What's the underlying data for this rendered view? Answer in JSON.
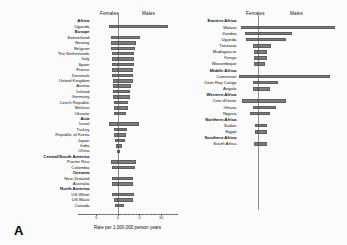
{
  "figure": {
    "axis_title": "Rate per 1,000,000 person years",
    "female_header": "Females",
    "male_header": "Males",
    "panel_a_letter": "A",
    "panel_b_letter": "B",
    "bar_color": "#7d7d7d",
    "bar_edge_color": "#5e5e5e",
    "axis_color": "#6f6f6f",
    "background": "#fbfbfb"
  },
  "chart_data": [
    {
      "type": "bar",
      "id": "panel-a",
      "title": "",
      "orientation": "horizontal-diverging",
      "xlabel": "Rate per 1,000,000 person years",
      "ylabel": "",
      "xlim": [
        -6,
        13
      ],
      "xticks": [
        -5,
        0,
        5,
        10
      ],
      "xticklabels": [
        "5",
        "0",
        "5",
        "10"
      ],
      "grid": false,
      "legend_position": "top",
      "series": [
        {
          "name": "Females",
          "direction": "left"
        },
        {
          "name": "Males",
          "direction": "right"
        }
      ],
      "categories": [
        "Africa",
        "Uganda",
        "Europe",
        "Switzerland",
        "Norway",
        "Belgium",
        "The Netherlands",
        "Italy",
        "Spain",
        "France",
        "Denmark",
        "United Kingdom",
        "Austria",
        "Ireland",
        "Germany",
        "Czech Republic",
        "Belarus",
        "Ukraine",
        "Asia",
        "Israel",
        "Turkey",
        "Republic of Korea",
        "Japan",
        "India",
        "China",
        "Central/South America",
        "Puerto Rico",
        "Colombia",
        "Oceania",
        "New Zealand",
        "Australia",
        "North America",
        "US White",
        "US Black",
        "Canada"
      ],
      "group_rows": [
        "Africa",
        "Europe",
        "Asia",
        "Central/South America",
        "Oceania",
        "North America"
      ],
      "females": [
        null,
        2.0,
        null,
        1.6,
        1.5,
        1.5,
        1.4,
        1.4,
        1.3,
        1.3,
        1.3,
        1.2,
        1.1,
        1.1,
        1.1,
        1.0,
        0.9,
        0.8,
        null,
        2.0,
        0.9,
        0.8,
        0.7,
        0.5,
        0.2,
        null,
        1.6,
        1.3,
        null,
        1.3,
        1.3,
        null,
        1.3,
        1.0,
        0.7
      ],
      "males": [
        null,
        11.6,
        null,
        5.2,
        4.2,
        4.0,
        3.8,
        3.8,
        3.7,
        3.6,
        3.4,
        3.4,
        3.0,
        2.9,
        2.8,
        2.4,
        2.3,
        1.8,
        null,
        5.0,
        2.2,
        1.8,
        1.6,
        0.9,
        0.3,
        null,
        4.2,
        3.9,
        null,
        3.6,
        3.6,
        null,
        3.7,
        3.5,
        1.5
      ]
    },
    {
      "type": "bar",
      "id": "panel-b",
      "title": "",
      "orientation": "horizontal-diverging",
      "xlabel": "Rate per 1,000,000 person years",
      "ylabel": "",
      "xlim": [
        -8,
        34
      ],
      "xticks": [
        -5,
        0,
        5,
        10,
        30
      ],
      "xticklabels": [
        "5",
        "0",
        "5",
        "10",
        "30"
      ],
      "grid": false,
      "legend_position": "top",
      "series": [
        {
          "name": "Females",
          "direction": "left"
        },
        {
          "name": "Males",
          "direction": "right"
        }
      ],
      "categories": [
        "Eastern Africa",
        "Malawi",
        "Zambia",
        "Uganda",
        "Tanzania",
        "Madagascar",
        "Kenya",
        "Mozambique",
        "Middle Africa",
        "Cameroon",
        "Dem Rep Congo",
        "Angola",
        "Western Africa",
        "Cote d'Ivoire",
        "Ghana",
        "Nigeria",
        "Northern Africa",
        "Sudan",
        "Egypt",
        "Southern Africa",
        "South Africa"
      ],
      "group_rows": [
        "Eastern Africa",
        "Middle Africa",
        "Western Africa",
        "Northern Africa",
        "Southern Africa"
      ],
      "females": [
        null,
        7.0,
        5.5,
        5.0,
        2.2,
        2.0,
        1.8,
        1.8,
        null,
        7.8,
        2.4,
        2.2,
        null,
        6.6,
        2.4,
        3.6,
        null,
        1.4,
        1.4,
        null,
        1.8
      ],
      "males": [
        null,
        31.5,
        14.0,
        11.5,
        5.2,
        3.6,
        3.6,
        2.6,
        null,
        29.5,
        8.0,
        4.6,
        null,
        11.2,
        7.2,
        4.6,
        null,
        3.6,
        3.4,
        null,
        3.6
      ]
    }
  ]
}
